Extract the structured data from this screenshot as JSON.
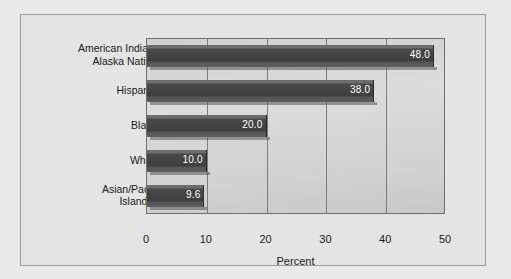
{
  "chart_data": {
    "type": "bar",
    "orientation": "horizontal",
    "title": "",
    "xlabel": "Percent",
    "ylabel": "",
    "categories": [
      "American Indians/\nAlaska Natives",
      "Hispanics",
      "Blacks",
      "Whites",
      "Asian/Pacific\nIslanders"
    ],
    "values": [
      48.0,
      38.0,
      20.0,
      10.0,
      9.6
    ],
    "value_labels": [
      "48.0",
      "38.0",
      "20.0",
      "10.0",
      "9.6"
    ],
    "xlim": [
      0,
      50
    ],
    "xticks": [
      0,
      10,
      20,
      30,
      40,
      50
    ],
    "xtick_labels": [
      "0",
      "10",
      "20",
      "30",
      "40",
      "50"
    ],
    "grid": "vertical",
    "legend": "none",
    "bar_color": "#454545",
    "plot_background": "#d4d4d4",
    "figure_background": "#e9e9e9"
  }
}
